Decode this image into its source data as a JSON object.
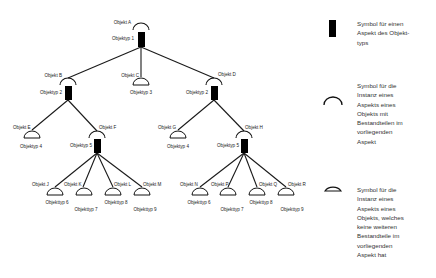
{
  "diagram": {
    "nodes": [
      {
        "id": "A",
        "label": "Objekt A",
        "type_label": "Objektyp 1",
        "kind": "composite"
      },
      {
        "id": "B",
        "label": "Objekt B",
        "type_label": "Objektyp 2",
        "kind": "composite"
      },
      {
        "id": "C",
        "label": "Objekt C",
        "type_label": "Objektyp 3",
        "kind": "leaf"
      },
      {
        "id": "D",
        "label": "Objekt D",
        "type_label": "Objektyp 2",
        "kind": "composite"
      },
      {
        "id": "E",
        "label": "Objekt E",
        "type_label": "Objektyp 4",
        "kind": "leaf"
      },
      {
        "id": "F",
        "label": "Objekt F",
        "type_label": "Objektyp 5",
        "kind": "composite"
      },
      {
        "id": "G",
        "label": "Objekt G",
        "type_label": "Objektyp 4",
        "kind": "leaf"
      },
      {
        "id": "H",
        "label": "Objekt H",
        "type_label": "Objektyp 5",
        "kind": "composite"
      },
      {
        "id": "J",
        "label": "Objekt J",
        "type_label": "Objekttyp 6",
        "kind": "leaf"
      },
      {
        "id": "K",
        "label": "Objekt K",
        "type_label": "Objekttyp 7",
        "kind": "leaf"
      },
      {
        "id": "L",
        "label": "Objekt L",
        "type_label": "Objekttyp 8",
        "kind": "leaf"
      },
      {
        "id": "M",
        "label": "Objekt M",
        "type_label": "Objekttyp 9",
        "kind": "leaf"
      },
      {
        "id": "N",
        "label": "Objekt N",
        "type_label": "Objekttyp 6",
        "kind": "leaf"
      },
      {
        "id": "P",
        "label": "Objekt P",
        "type_label": "Objekttyp 7",
        "kind": "leaf"
      },
      {
        "id": "Q",
        "label": "Objekt Q",
        "type_label": "Objekttyp 8",
        "kind": "leaf"
      },
      {
        "id": "R",
        "label": "Objekt R",
        "type_label": "Objekttyp 9",
        "kind": "leaf"
      }
    ],
    "edges": [
      [
        "A",
        "B"
      ],
      [
        "A",
        "C"
      ],
      [
        "A",
        "D"
      ],
      [
        "B",
        "E"
      ],
      [
        "B",
        "F"
      ],
      [
        "D",
        "G"
      ],
      [
        "D",
        "H"
      ],
      [
        "F",
        "J"
      ],
      [
        "F",
        "K"
      ],
      [
        "F",
        "L"
      ],
      [
        "F",
        "M"
      ],
      [
        "H",
        "N"
      ],
      [
        "H",
        "P"
      ],
      [
        "H",
        "Q"
      ],
      [
        "H",
        "R"
      ]
    ]
  },
  "legend": {
    "items": [
      {
        "symbol": "filled-rectangle",
        "text": "Symbol für einen\nAspekt des Objekt-\ntyps"
      },
      {
        "symbol": "open-arc",
        "text": "Symbol für die\nInstanz eines\nAspekts eines\nObjekts mit\nBestandteilen im\nvorliegenden\nAspekt"
      },
      {
        "symbol": "half-disc",
        "text": "Symbol für die\nInstanz eines\nAspekts eines\nObjekts, welches\nkeine weiteren\nBestandteile im\nvorliegenden\nAspekt hat"
      }
    ]
  }
}
